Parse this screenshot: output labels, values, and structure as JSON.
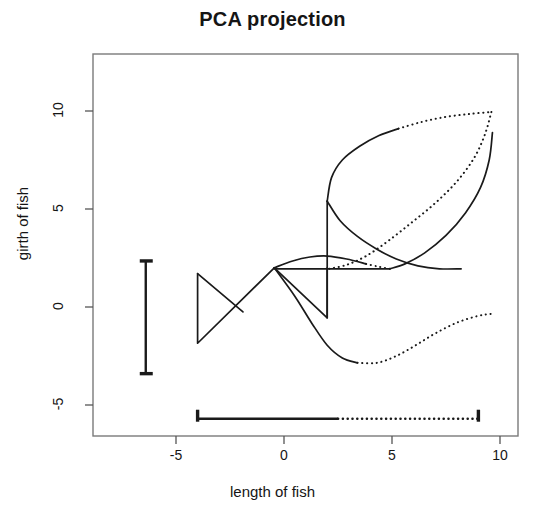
{
  "chart_data": {
    "type": "line",
    "title": "PCA projection",
    "xlabel": "length of fish",
    "ylabel": "girth of fish",
    "xlim": [
      -6.8,
      10.9
    ],
    "ylim": [
      -5.9,
      11.6
    ],
    "xticks": [
      -5,
      0,
      5,
      10
    ],
    "xtick_labels": [
      "-5",
      "0",
      "5",
      "10"
    ],
    "yticks": [
      -5,
      0,
      5,
      10
    ],
    "ytick_labels": [
      "-5",
      "0",
      "5",
      "10"
    ],
    "grid": false,
    "legend": null,
    "annotations": [
      {
        "name": "x-range-marker",
        "orientation": "horizontal",
        "y": -5.7,
        "from": -4.0,
        "to": 9.0,
        "style": "solid-then-dotted",
        "caps": true
      },
      {
        "name": "y-range-marker",
        "orientation": "vertical",
        "x": -6.4,
        "from": -3.4,
        "to": 2.35,
        "style": "solid",
        "caps": true
      }
    ],
    "series": [
      {
        "name": "fish-tail-outline",
        "style": "solid",
        "points": [
          [
            -4.0,
            1.7
          ],
          [
            -4.0,
            -1.85
          ],
          [
            -0.45,
            2.0
          ]
        ]
      },
      {
        "name": "fish-tail-cross",
        "style": "solid",
        "points": [
          [
            -4.0,
            1.7
          ],
          [
            -1.9,
            -0.25
          ]
        ]
      },
      {
        "name": "fish-body-upper-solid",
        "style": "solid",
        "points": [
          [
            -0.45,
            2.0
          ],
          [
            0.4,
            2.35
          ],
          [
            1.2,
            2.55
          ],
          [
            2.0,
            2.6
          ],
          [
            2.9,
            2.45
          ],
          [
            3.8,
            2.2
          ]
        ]
      },
      {
        "name": "fish-body-upper-dotted",
        "style": "dotted",
        "points": [
          [
            3.8,
            2.2
          ],
          [
            4.4,
            2.05
          ],
          [
            4.9,
            1.95
          ]
        ]
      },
      {
        "name": "fish-body-lower-solid",
        "style": "solid",
        "points": [
          [
            -0.45,
            2.0
          ],
          [
            0.5,
            0.55
          ],
          [
            1.3,
            -0.85
          ],
          [
            2.0,
            -1.95
          ],
          [
            2.7,
            -2.6
          ],
          [
            3.4,
            -2.85
          ]
        ]
      },
      {
        "name": "fish-body-lower-dotted",
        "style": "dotted",
        "points": [
          [
            3.4,
            -2.85
          ],
          [
            4.3,
            -2.85
          ],
          [
            5.2,
            -2.5
          ],
          [
            6.1,
            -1.95
          ],
          [
            7.0,
            -1.35
          ],
          [
            8.0,
            -0.8
          ],
          [
            9.0,
            -0.45
          ],
          [
            9.6,
            -0.35
          ]
        ]
      },
      {
        "name": "fish-fin-triangle",
        "style": "solid",
        "points": [
          [
            -0.45,
            2.0
          ],
          [
            2.0,
            -0.55
          ],
          [
            2.0,
            2.0
          ]
        ]
      },
      {
        "name": "fish-mouth-line",
        "style": "solid",
        "points": [
          [
            -0.45,
            1.95
          ],
          [
            4.9,
            1.95
          ]
        ]
      },
      {
        "name": "leaf-spine-vertical",
        "style": "solid",
        "points": [
          [
            2.0,
            -0.55
          ],
          [
            2.0,
            5.4
          ]
        ]
      },
      {
        "name": "leaf-upper-solid",
        "style": "solid",
        "points": [
          [
            2.0,
            5.4
          ],
          [
            2.2,
            6.6
          ],
          [
            2.7,
            7.5
          ],
          [
            3.5,
            8.2
          ],
          [
            4.4,
            8.75
          ],
          [
            5.3,
            9.1
          ]
        ]
      },
      {
        "name": "leaf-upper-dotted",
        "style": "dotted",
        "points": [
          [
            5.3,
            9.1
          ],
          [
            6.4,
            9.45
          ],
          [
            7.5,
            9.7
          ],
          [
            8.6,
            9.85
          ],
          [
            9.6,
            9.95
          ]
        ]
      },
      {
        "name": "leaf-right-dotted",
        "style": "dotted",
        "points": [
          [
            9.6,
            9.95
          ],
          [
            9.3,
            8.8
          ],
          [
            8.8,
            7.6
          ],
          [
            8.0,
            6.4
          ],
          [
            7.0,
            5.3
          ],
          [
            5.9,
            4.3
          ],
          [
            4.8,
            3.35
          ],
          [
            3.8,
            2.6
          ],
          [
            2.9,
            2.15
          ],
          [
            2.1,
            1.95
          ]
        ]
      },
      {
        "name": "leaf-inner-solid",
        "style": "solid",
        "points": [
          [
            2.0,
            5.4
          ],
          [
            2.6,
            4.4
          ],
          [
            3.4,
            3.6
          ],
          [
            4.3,
            2.95
          ],
          [
            5.2,
            2.45
          ],
          [
            6.2,
            2.1
          ],
          [
            7.2,
            1.95
          ],
          [
            8.2,
            1.95
          ]
        ]
      },
      {
        "name": "leaf-inner-solid-tail",
        "style": "solid",
        "points": [
          [
            4.9,
            1.95
          ],
          [
            5.6,
            2.2
          ],
          [
            6.5,
            2.75
          ],
          [
            7.5,
            3.65
          ],
          [
            8.4,
            4.8
          ],
          [
            9.1,
            6.1
          ],
          [
            9.5,
            7.5
          ],
          [
            9.65,
            8.9
          ]
        ]
      }
    ]
  },
  "axis": {
    "title": "PCA projection",
    "xlabel": "length of fish",
    "ylabel": "girth of fish"
  }
}
